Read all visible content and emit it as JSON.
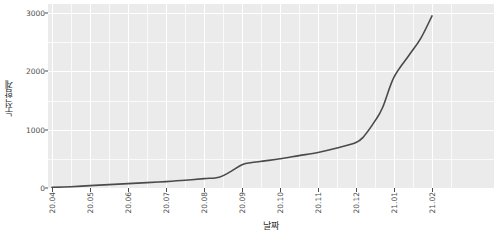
{
  "chart_data": {
    "type": "line",
    "title": "",
    "xlabel": "날짜",
    "ylabel": "누적합계",
    "grid": true,
    "legend": false,
    "ylim": [
      0,
      3100
    ],
    "y_ticks": [
      0,
      1000,
      2000,
      3000
    ],
    "y_tick_labels": [
      "0",
      "1000",
      "2000",
      "3000"
    ],
    "x_tick_labels": [
      "20.04",
      "20.05",
      "20.06",
      "20.07",
      "20.08",
      "20.09",
      "20.10",
      "20.11",
      "20.12",
      "21.01",
      "21.02"
    ],
    "series": [
      {
        "name": "누적합계",
        "color": "#4a4a4a",
        "x": [
          "20.04",
          "20.05",
          "20.06",
          "20.07",
          "20.08",
          "20.09",
          "20.10",
          "20.11",
          "20.12",
          "21.01",
          "21.02"
        ],
        "values": [
          10,
          40,
          75,
          110,
          160,
          400,
          500,
          610,
          780,
          1900,
          2950
        ],
        "points": [
          {
            "x": "20.04",
            "y": 10
          },
          {
            "x": "20.04.5",
            "y": 22
          },
          {
            "x": "20.05",
            "y": 40
          },
          {
            "x": "20.05.5",
            "y": 58
          },
          {
            "x": "20.06",
            "y": 75
          },
          {
            "x": "20.06.5",
            "y": 92
          },
          {
            "x": "20.07",
            "y": 110
          },
          {
            "x": "20.07.5",
            "y": 132
          },
          {
            "x": "20.08",
            "y": 160
          },
          {
            "x": "20.08.4",
            "y": 185
          },
          {
            "x": "20.08.7",
            "y": 280
          },
          {
            "x": "20.09",
            "y": 400
          },
          {
            "x": "20.09.3",
            "y": 440
          },
          {
            "x": "20.09.6",
            "y": 465
          },
          {
            "x": "20.10",
            "y": 500
          },
          {
            "x": "20.10.5",
            "y": 555
          },
          {
            "x": "20.11",
            "y": 610
          },
          {
            "x": "20.11.5",
            "y": 685
          },
          {
            "x": "20.12",
            "y": 780
          },
          {
            "x": "20.12.2",
            "y": 880
          },
          {
            "x": "20.12.5",
            "y": 1150
          },
          {
            "x": "20.12.7",
            "y": 1380
          },
          {
            "x": "21.01",
            "y": 1900
          },
          {
            "x": "21.01.4",
            "y": 2280
          },
          {
            "x": "21.01.7",
            "y": 2560
          },
          {
            "x": "21.02",
            "y": 2950
          }
        ]
      }
    ]
  },
  "axes": {
    "y_title": "누적합계",
    "x_title": "날짜"
  }
}
